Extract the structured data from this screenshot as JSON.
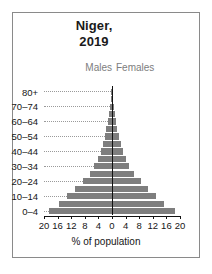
{
  "chart_data": {
    "type": "bar",
    "subtype": "population-pyramid",
    "title": "Niger, 2019",
    "title_lines": [
      "Niger,",
      "2019"
    ],
    "xlabel": "% of population",
    "ylabel": "",
    "xlim": [
      -20,
      20
    ],
    "xticks": [
      -20,
      -16,
      -12,
      -8,
      -4,
      0,
      4,
      8,
      12,
      16,
      20
    ],
    "xtick_labels": [
      "20",
      "16",
      "12",
      "8",
      "4",
      "0",
      "4",
      "8",
      "12",
      "16",
      "20"
    ],
    "grid": true,
    "legend_position": "top-inside",
    "bar_color": "#7e7e7e",
    "axis_color": "#111111",
    "legend": [
      {
        "name": "Males",
        "side": "left",
        "color": "#7d7d7d"
      },
      {
        "name": "Females",
        "side": "right",
        "color": "#7d7d7d"
      }
    ],
    "categories": [
      "0–4",
      "5–9",
      "10–14",
      "15–19",
      "20–24",
      "25–29",
      "30–34",
      "35–39",
      "40–44",
      "45–49",
      "50–54",
      "55–59",
      "60–64",
      "65–69",
      "70–74",
      "75–79",
      "80+"
    ],
    "ytick_labels": [
      "0–4",
      "10–14",
      "20–24",
      "30–34",
      "40–44",
      "50–54",
      "60–64",
      "70–74",
      "80+"
    ],
    "series": [
      {
        "name": "Males",
        "side": "left",
        "values": [
          18.6,
          15.6,
          13.3,
          10.9,
          8.6,
          6.6,
          5.2,
          4.1,
          3.3,
          2.7,
          2.2,
          1.7,
          1.3,
          0.9,
          0.6,
          0.35,
          0.2
        ]
      },
      {
        "name": "Females",
        "side": "right",
        "values": [
          18.4,
          15.3,
          13.0,
          10.6,
          8.4,
          6.5,
          5.1,
          4.0,
          3.2,
          2.6,
          2.1,
          1.6,
          1.2,
          0.85,
          0.55,
          0.3,
          0.2
        ]
      }
    ]
  }
}
